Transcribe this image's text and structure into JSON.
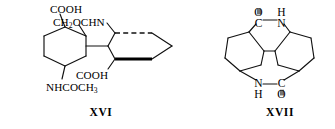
{
  "figure": {
    "background_color": "#ffffff",
    "ink_color": "#000000",
    "width": 335,
    "height": 129
  },
  "structures": [
    {
      "id": "xvi",
      "caption": "XVI",
      "caption_x": 100,
      "caption_y": 108,
      "description": "Cyclohexane ring bearing COOH, CH2OCHN and NHCOCH3 substituents linked to a second ring drawn with bold and dashed bonds",
      "substituents": [
        {
          "name": "carboxyl-top",
          "text": "COOH",
          "sub": "",
          "x": 50,
          "y": 4
        },
        {
          "name": "formamido",
          "text": "CH",
          "sub": "2",
          "tail": "OCHN",
          "x": 53,
          "y": 17
        },
        {
          "name": "carboxyl-inner",
          "text": "COOH",
          "sub": "",
          "x": 76,
          "y": 70
        },
        {
          "name": "acetamido",
          "text": "NHCOCH",
          "sub": "3",
          "tail": "",
          "x": 46,
          "y": 82
        }
      ]
    },
    {
      "id": "xvii",
      "caption": "XVII",
      "caption_x": 279,
      "caption_y": 108,
      "description": "Centrosymmetric tetracyclic bis-lactam: two cyclohexane rings fused through two six-membered lactam rings",
      "atoms": [
        {
          "name": "carbonyl-carbon-top",
          "text": "C",
          "x": 258,
          "y": 18
        },
        {
          "name": "carbonyl-oxygen-top",
          "text": "O",
          "x": 258,
          "y": 8
        },
        {
          "name": "amide-nitrogen-top",
          "text": "N",
          "x": 281,
          "y": 18
        },
        {
          "name": "amide-hydrogen-top",
          "text": "H",
          "x": 281,
          "y": 8
        },
        {
          "name": "amide-nitrogen-bottom",
          "text": "N",
          "x": 258,
          "y": 84
        },
        {
          "name": "amide-hydrogen-bottom",
          "text": "H",
          "x": 258,
          "y": 94
        },
        {
          "name": "carbonyl-carbon-bottom",
          "text": "C",
          "x": 281,
          "y": 84
        },
        {
          "name": "carbonyl-oxygen-bottom",
          "text": "O",
          "x": 281,
          "y": 94
        }
      ]
    }
  ]
}
